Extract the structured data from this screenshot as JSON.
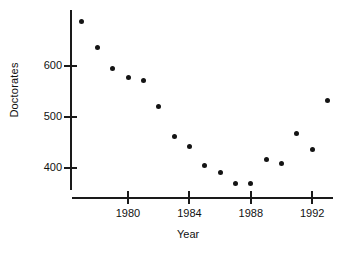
{
  "chart_data": {
    "type": "scatter",
    "title": "",
    "xlabel": "Year",
    "ylabel": "Doctorates",
    "x": [
      1977,
      1978,
      1979,
      1980,
      1981,
      1982,
      1983,
      1984,
      1985,
      1986,
      1987,
      1988,
      1989,
      1990,
      1991,
      1992,
      1993
    ],
    "values": [
      688,
      637,
      595,
      577,
      572,
      520,
      461,
      442,
      404,
      391,
      369,
      370,
      417,
      408,
      468,
      437,
      532
    ],
    "xlim": [
      1976.2,
      1993.5
    ],
    "ylim": [
      350,
      700
    ],
    "xticks": [
      1980,
      1984,
      1988,
      1992
    ],
    "xticklabels": [
      "1980",
      "1984",
      "1988",
      "1992"
    ],
    "yticks": [
      400,
      500,
      600
    ],
    "yticklabels": [
      "400",
      "500",
      "600"
    ],
    "grid": false,
    "legend": null,
    "marker": "filled-circle",
    "marker_color": "#141414",
    "axis_color": "#1a1a1a",
    "background": "#ffffff"
  },
  "axes": {
    "ylabel": "Doctorates",
    "xlabel": "Year"
  }
}
